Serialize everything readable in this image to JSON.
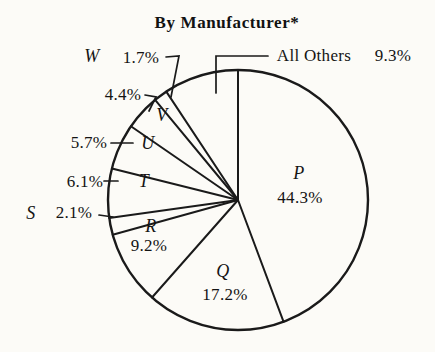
{
  "title": "By Manufacturer*",
  "colors": {
    "ink": "#1a1a1a",
    "paper": "#fcfbf7"
  },
  "chart_data": {
    "type": "pie",
    "title": "By Manufacturer*",
    "unit": "%",
    "start_angle": "12-o-clock",
    "direction": "clockwise",
    "legend_position": "none",
    "slices": [
      {
        "label": "P",
        "value": 44.3,
        "display": "44.3%",
        "label_placement": "inside"
      },
      {
        "label": "Q",
        "value": 17.2,
        "display": "17.2%",
        "label_placement": "inside"
      },
      {
        "label": "R",
        "value": 9.2,
        "display": "9.2%",
        "label_placement": "inside"
      },
      {
        "label": "S",
        "value": 2.1,
        "display": "2.1%",
        "label_placement": "outside-left"
      },
      {
        "label": "T",
        "value": 6.1,
        "display": "6.1%",
        "label_placement": "letter-inside-pct-outside"
      },
      {
        "label": "U",
        "value": 5.7,
        "display": "5.7%",
        "label_placement": "letter-inside-pct-outside"
      },
      {
        "label": "V",
        "value": 4.4,
        "display": "4.4%",
        "label_placement": "letter-inside-pct-outside"
      },
      {
        "label": "W",
        "value": 1.7,
        "display": "1.7%",
        "label_placement": "outside-top"
      },
      {
        "label": "All Others",
        "value": 9.3,
        "display": "9.3%",
        "label_placement": "outside-callout"
      }
    ]
  }
}
